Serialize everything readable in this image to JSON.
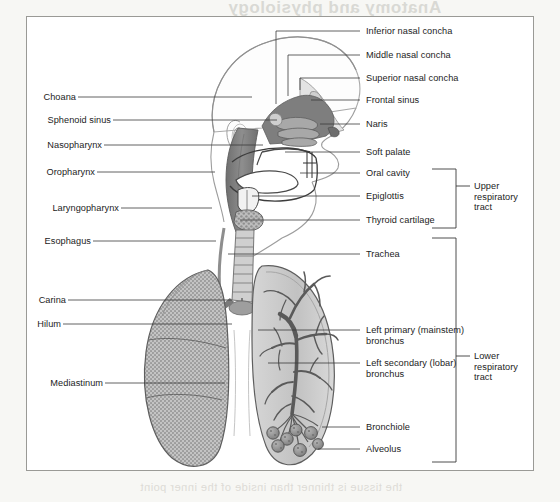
{
  "page": {
    "bleed_text_top": "Anatomy and physiology",
    "bleed_text_top2": "of the respiratory",
    "bleed_text_mid": "the lungs are the",
    "bleed_text_mid2": "upper and lower tract",
    "bleed_text_mid3": "divides at the carina",
    "bleed_text_bottom": "the tissue is thinner than inside of the inner point"
  },
  "colors": {
    "frame_border": "#9a9a96",
    "label_text": "#1c1c1c",
    "leader_line": "#3a3a3a",
    "airway_fill": "#8e8e8e",
    "lung_fill": "#c9c9c9",
    "ghost_text": "#d9d9d4",
    "paper": "#ffffff"
  },
  "labels_left": [
    {
      "id": "choana",
      "text": "Choana",
      "y": 97,
      "line_to_x": 252,
      "line_to_y": 97
    },
    {
      "id": "sphenoid-sinus",
      "text": "Sphenoid sinus",
      "y": 120,
      "line_to_x": 277,
      "line_to_y": 120
    },
    {
      "id": "nasopharynx",
      "text": "Nasopharynx",
      "y": 145,
      "line_to_x": 263,
      "line_to_y": 145
    },
    {
      "id": "oropharynx",
      "text": "Oropharynx",
      "y": 172,
      "line_to_x": 215,
      "line_to_y": 172
    },
    {
      "id": "laryngopharynx",
      "text": "Laryngopharynx",
      "y": 208,
      "line_to_x": 212,
      "line_to_y": 208
    },
    {
      "id": "esophagus",
      "text": "Esophagus",
      "y": 241,
      "line_to_x": 216,
      "line_to_y": 241
    },
    {
      "id": "carina",
      "text": "Carina",
      "y": 300,
      "line_to_x": 232,
      "line_to_y": 300
    },
    {
      "id": "hilum",
      "text": "Hilum",
      "y": 324,
      "line_to_x": 232,
      "line_to_y": 324
    },
    {
      "id": "mediastinum",
      "text": "Mediastinum",
      "y": 383,
      "line_to_x": 225,
      "line_to_y": 383
    }
  ],
  "labels_right": [
    {
      "id": "inferior-nasal-concha",
      "text": "Inferior nasal concha",
      "y": 31,
      "line_from_x": 276,
      "line_from_y": 104
    },
    {
      "id": "middle-nasal-concha",
      "text": "Middle nasal concha",
      "y": 55,
      "line_from_x": 288,
      "line_from_y": 96
    },
    {
      "id": "superior-nasal-concha",
      "text": "Superior nasal concha",
      "y": 78,
      "line_from_x": 300,
      "line_from_y": 90
    },
    {
      "id": "frontal-sinus",
      "text": "Frontal sinus",
      "y": 100,
      "line_from_x": 311,
      "line_from_y": 100
    },
    {
      "id": "naris",
      "text": "Naris",
      "y": 124,
      "line_from_x": 320,
      "line_from_y": 124
    },
    {
      "id": "soft-palate",
      "text": "Soft palate",
      "y": 152,
      "line_from_x": 285,
      "line_from_y": 152
    },
    {
      "id": "oral-cavity",
      "text": "Oral cavity",
      "y": 173,
      "line_from_x": 300,
      "line_from_y": 173
    },
    {
      "id": "epiglottis",
      "text": "Epiglottis",
      "y": 196,
      "line_from_x": 252,
      "line_from_y": 196
    },
    {
      "id": "thyroid-cartilage",
      "text": "Thyroid cartilage",
      "y": 220,
      "line_from_x": 240,
      "line_from_y": 220
    },
    {
      "id": "trachea",
      "text": "Trachea",
      "y": 254,
      "line_from_x": 228,
      "line_from_y": 254
    },
    {
      "id": "bronchiole",
      "text": "Bronchiole",
      "y": 427,
      "line_from_x": 322,
      "line_from_y": 427
    },
    {
      "id": "alveolus",
      "text": "Alveolus",
      "y": 449,
      "line_from_x": 318,
      "line_from_y": 449
    }
  ],
  "labels_right_wrapped": [
    {
      "id": "left-primary-bronchus",
      "line1": "Left primary (mainstem)",
      "line2": "bronchus",
      "y": 330,
      "line_from_x": 258,
      "line_from_y": 330
    },
    {
      "id": "left-secondary-bronchus",
      "line1": "Left secondary (lobar)",
      "line2": "bronchus",
      "y": 363,
      "line_from_x": 268,
      "line_from_y": 363
    }
  ],
  "brackets": [
    {
      "id": "upper-respiratory-tract",
      "line1": "Upper",
      "line2": "respiratory",
      "line3": "tract",
      "top": 169,
      "bottom": 228,
      "tick_y": 186,
      "x": 462
    },
    {
      "id": "lower-respiratory-tract",
      "line1": "Lower",
      "line2": "respiratory",
      "line3": "tract",
      "top": 238,
      "bottom": 462,
      "tick_y": 356,
      "x": 462
    }
  ],
  "anatomy_parts": [
    "skull-outline",
    "ear",
    "nasal-conchae",
    "frontal-sinus",
    "sphenoid-sinus",
    "naris",
    "soft-palate",
    "oral-cavity",
    "tongue",
    "nasopharynx",
    "oropharynx",
    "laryngopharynx",
    "epiglottis",
    "thyroid-cartilage",
    "trachea",
    "esophagus",
    "carina",
    "hilum",
    "left-lung-solid",
    "right-lung-bronchial-tree",
    "primary-bronchus",
    "secondary-bronchus",
    "bronchiole",
    "alveolus-cluster",
    "mediastinum",
    "diaphragm-outline"
  ]
}
